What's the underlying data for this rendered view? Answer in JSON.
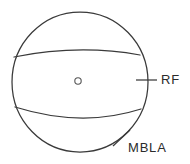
{
  "figure": {
    "background_color": "#ffffff",
    "stroke_color": "#3a3a3a",
    "body": {
      "name": "circle-outline",
      "center_x": 80,
      "center_y": 82,
      "radius_x": 68,
      "radius_y": 70
    },
    "center_marker": {
      "name": "center-point",
      "x": 78,
      "y": 81,
      "radius": 3.2,
      "glyph": "o"
    },
    "bands": [
      {
        "name": "upper-band-boundary",
        "shape": "arc-convex-up",
        "left_x": 14,
        "left_y": 57,
        "right_x": 140,
        "right_y": 55,
        "mid_x": 78,
        "mid_y": 50
      },
      {
        "name": "lower-band-boundary",
        "shape": "arc-concave-down",
        "left_x": 15,
        "left_y": 107,
        "right_x": 141,
        "right_y": 109,
        "mid_x": 80,
        "mid_y": 118
      }
    ],
    "annotations": [
      {
        "id": "rf",
        "label": "RF",
        "label_x": 161,
        "label_y": 80,
        "leader": {
          "type": "horizontal-tick",
          "x1": 136,
          "y1": 80,
          "x2": 157,
          "y2": 80
        }
      },
      {
        "id": "mbla",
        "label": "MBLA",
        "label_x": 128,
        "label_y": 148,
        "leader": {
          "type": "diagonal-tick",
          "x1": 113,
          "y1": 146,
          "x2": 130,
          "y2": 130
        }
      }
    ]
  }
}
